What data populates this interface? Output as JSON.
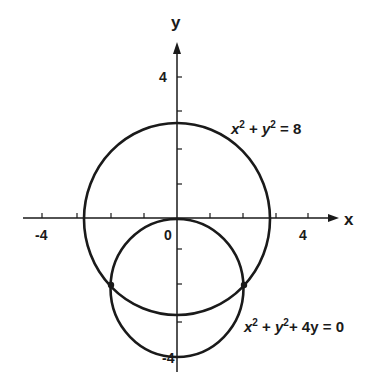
{
  "axes": {
    "x_label": "x",
    "y_label": "y",
    "tick_labels": {
      "x_neg": "-4",
      "x_pos": "4",
      "origin": "0",
      "y_pos": "4",
      "y_neg": "-4"
    }
  },
  "curves": [
    {
      "name": "large-circle",
      "equation_parts": {
        "a": "x",
        "a_exp": "2",
        "plus": " + ",
        "b": "y",
        "b_exp": "2",
        "rest": " = 8"
      },
      "center": [
        0,
        0
      ],
      "radius": 2.83
    },
    {
      "name": "small-circle",
      "equation_parts": {
        "a": "x",
        "a_exp": "2",
        "plus": " + ",
        "b": "y",
        "b_exp": "2",
        "rest": "+ 4y = 0"
      },
      "center": [
        0,
        -2
      ],
      "radius": 2
    }
  ],
  "intersections": [
    [
      -2,
      -2
    ],
    [
      2,
      -2
    ]
  ],
  "colors": {
    "stroke": "#1a1a1a",
    "background": "#ffffff"
  }
}
